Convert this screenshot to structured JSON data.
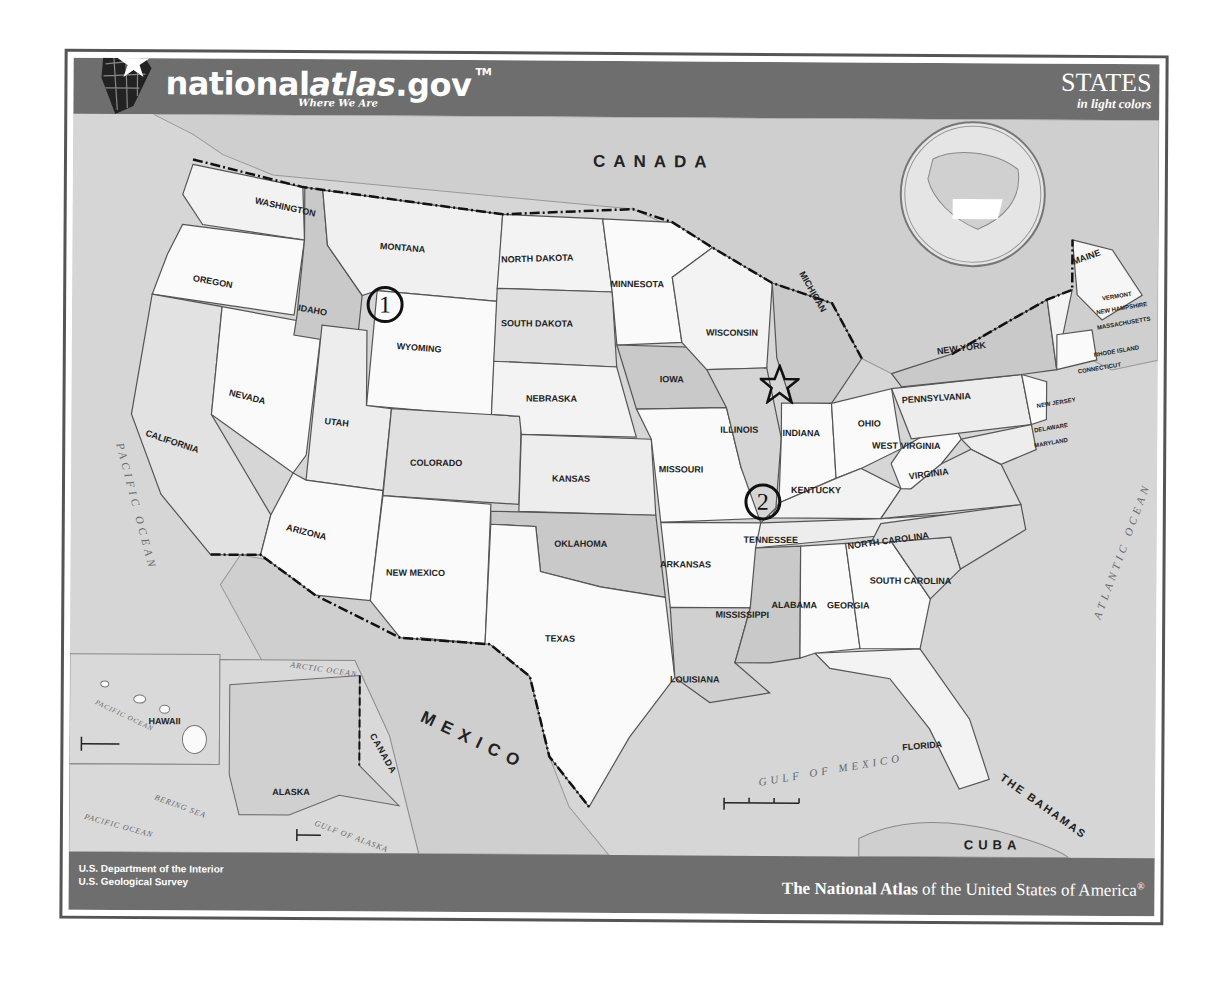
{
  "header": {
    "logo_main": "national",
    "logo_italic": "atlas",
    "logo_suffix": ".gov",
    "logo_tm": "TM",
    "tagline": "Where We Are",
    "title": "STATES",
    "subtitle": "in light colors"
  },
  "footer": {
    "agency_line1": "U.S. Department of the Interior",
    "agency_line2": "U.S. Geological Survey",
    "atlas_bold": "The National Atlas",
    "atlas_rest": " of the United States of America",
    "atlas_mark": "®"
  },
  "countries": {
    "canada": "CANADA",
    "mexico": "MEXICO",
    "cuba": "CUBA",
    "bahamas": "THE BAHAMAS",
    "canada_inset": "CANADA"
  },
  "water": {
    "pacific": "PACIFIC OCEAN",
    "atlantic": "ATLANTIC OCEAN",
    "gulf": "GULF OF MEXICO",
    "arctic": "ARCTIC OCEAN",
    "bering": "BERING SEA",
    "gulf_alaska": "GULF OF ALASKA",
    "pacific_inset": "PACIFIC OCEAN",
    "pacific_hawaii": "PACIFIC OCEAN"
  },
  "states": [
    {
      "name": "WASHINGTON",
      "x": 212,
      "y": 95,
      "r": 12
    },
    {
      "name": "OREGON",
      "x": 140,
      "y": 170,
      "r": 10
    },
    {
      "name": "CALIFORNIA",
      "x": 100,
      "y": 330,
      "r": 18
    },
    {
      "name": "IDAHO",
      "x": 240,
      "y": 198,
      "r": 10
    },
    {
      "name": "NEVADA",
      "x": 175,
      "y": 285,
      "r": 14
    },
    {
      "name": "MONTANA",
      "x": 330,
      "y": 135,
      "r": 4
    },
    {
      "name": "WYOMING",
      "x": 347,
      "y": 235,
      "r": 4
    },
    {
      "name": "UTAH",
      "x": 265,
      "y": 310,
      "r": 6
    },
    {
      "name": "ARIZONA",
      "x": 235,
      "y": 420,
      "r": 14
    },
    {
      "name": "COLORADO",
      "x": 365,
      "y": 350,
      "r": 0
    },
    {
      "name": "NEW MEXICO",
      "x": 345,
      "y": 460,
      "r": 0
    },
    {
      "name": "NORTH DAKOTA",
      "x": 465,
      "y": 145,
      "r": -2
    },
    {
      "name": "SOUTH DAKOTA",
      "x": 465,
      "y": 210,
      "r": 0
    },
    {
      "name": "NEBRASKA",
      "x": 480,
      "y": 285,
      "r": 0
    },
    {
      "name": "KANSAS",
      "x": 500,
      "y": 365,
      "r": 0
    },
    {
      "name": "OKLAHOMA",
      "x": 510,
      "y": 430,
      "r": 0
    },
    {
      "name": "TEXAS",
      "x": 490,
      "y": 525,
      "r": 0
    },
    {
      "name": "MINNESOTA",
      "x": 565,
      "y": 170,
      "r": 0
    },
    {
      "name": "IOWA",
      "x": 600,
      "y": 265,
      "r": 0
    },
    {
      "name": "MISSOURI",
      "x": 610,
      "y": 355,
      "r": 0
    },
    {
      "name": "ARKANSAS",
      "x": 615,
      "y": 450,
      "r": 0
    },
    {
      "name": "LOUISIANA",
      "x": 625,
      "y": 565,
      "r": 0
    },
    {
      "name": "WISCONSIN",
      "x": 660,
      "y": 218,
      "r": 0
    },
    {
      "name": "ILLINOIS",
      "x": 668,
      "y": 315,
      "r": 0
    },
    {
      "name": "MICHIGAN",
      "x": 738,
      "y": 175,
      "r": 60
    },
    {
      "name": "INDIANA",
      "x": 730,
      "y": 318,
      "r": 0
    },
    {
      "name": "OHIO",
      "x": 798,
      "y": 308,
      "r": 0
    },
    {
      "name": "KENTUCKY",
      "x": 745,
      "y": 375,
      "r": 0
    },
    {
      "name": "TENNESSEE",
      "x": 700,
      "y": 425,
      "r": 0
    },
    {
      "name": "MISSISSIPPI",
      "x": 672,
      "y": 500,
      "r": 0
    },
    {
      "name": "ALABAMA",
      "x": 724,
      "y": 490,
      "r": 0
    },
    {
      "name": "GEORGIA",
      "x": 778,
      "y": 490,
      "r": 0
    },
    {
      "name": "FLORIDA",
      "x": 853,
      "y": 630,
      "r": -5
    },
    {
      "name": "SOUTH CAROLINA",
      "x": 840,
      "y": 465,
      "r": 0
    },
    {
      "name": "NORTH CAROLINA",
      "x": 818,
      "y": 425,
      "r": -8
    },
    {
      "name": "VIRGINIA",
      "x": 858,
      "y": 358,
      "r": -8
    },
    {
      "name": "WEST VIRGINIA",
      "x": 835,
      "y": 330,
      "r": 0
    },
    {
      "name": "PENNSYLVANIA",
      "x": 865,
      "y": 282,
      "r": -4
    },
    {
      "name": "NEW YORK",
      "x": 890,
      "y": 232,
      "r": -8
    },
    {
      "name": "MAINE",
      "x": 1015,
      "y": 140,
      "r": -20
    },
    {
      "name": "VERMONT",
      "x": 1045,
      "y": 178,
      "r": -10
    },
    {
      "name": "NEW HAMPSHIRE",
      "x": 1050,
      "y": 190,
      "r": -10
    },
    {
      "name": "MASSACHUSETTS",
      "x": 1052,
      "y": 205,
      "r": -10
    },
    {
      "name": "RHODE ISLAND",
      "x": 1045,
      "y": 233,
      "r": -10
    },
    {
      "name": "CONNECTICUT",
      "x": 1028,
      "y": 250,
      "r": -10
    },
    {
      "name": "NEW JERSEY",
      "x": 985,
      "y": 285,
      "r": -10
    },
    {
      "name": "DELAWARE",
      "x": 980,
      "y": 310,
      "r": -10
    },
    {
      "name": "MARYLAND",
      "x": 980,
      "y": 325,
      "r": -10
    },
    {
      "name": "ALASKA",
      "x": 222,
      "y": 680,
      "r": 0
    },
    {
      "name": "HAWAII",
      "x": 95,
      "y": 610,
      "r": 0
    }
  ],
  "markers": [
    {
      "type": "circle",
      "label": "1",
      "x": 313,
      "y": 245
    },
    {
      "type": "star",
      "label": "",
      "x": 708,
      "y": 322
    },
    {
      "type": "circle",
      "label": "2",
      "x": 692,
      "y": 440
    }
  ],
  "scale_bars": {
    "main": {
      "mi": [
        "0",
        "100",
        "200",
        "300 mi"
      ],
      "km": [
        "100",
        "200",
        "300 km"
      ]
    },
    "hawaii": {
      "mi": "100 mi",
      "km": "100 km"
    },
    "alaska": {
      "mi": "200 mi",
      "km": "200 km"
    }
  }
}
